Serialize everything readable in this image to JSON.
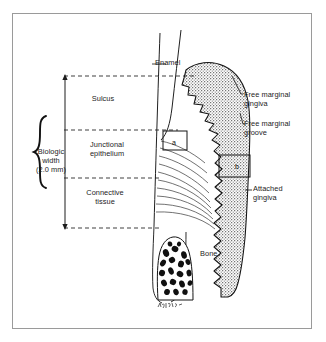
{
  "figure": {
    "background_color": "#ffffff",
    "frame_color": "#9a9a9a",
    "ink_color": "#1c1c1c",
    "gingiva_fill": "#8c8c8c"
  },
  "labels": {
    "biologic_width": "Biologic\nwidth\n(2.0 mm)",
    "sulcus": "Sulcus",
    "junctional_epithelium": "Junctional\nepithelium",
    "connective_tissue": "Connective\ntissue",
    "enamel": "Enamel",
    "bone": "Bone",
    "free_marginal_gingiva": "Free marginal\ngingiva",
    "free_marginal_groove": "Free marginal\ngroove",
    "attached_gingiva": "Attached\ngingiva"
  },
  "callout_boxes": [
    {
      "id": "a",
      "letter": "a",
      "region": "junctional-epithelium-detail"
    },
    {
      "id": "b",
      "letter": "b",
      "region": "attached-gingiva-detail"
    }
  ],
  "measurements": {
    "biologic_width_value": "2.0 mm"
  },
  "zones": [
    {
      "name": "sulcus",
      "order": 1
    },
    {
      "name": "junctional epithelium",
      "order": 2
    },
    {
      "name": "connective tissue",
      "order": 3
    }
  ],
  "signature": "artist signature"
}
